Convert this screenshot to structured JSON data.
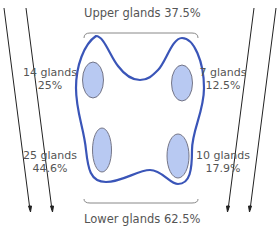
{
  "title": {
    "upper": "Upper glands 37.5%",
    "lower": "Lower glands 62.5%"
  },
  "glands": [
    {
      "id": "upper-left",
      "count": "14 glands",
      "percent": "25%"
    },
    {
      "id": "upper-right",
      "count": "7 glands",
      "percent": "12.5%"
    },
    {
      "id": "lower-left",
      "count": "25 glands",
      "percent": "44.6%"
    },
    {
      "id": "lower-right",
      "count": "10 glands",
      "percent": "17.9%"
    }
  ],
  "colors": {
    "outline": "#3a55b8",
    "gland_fill": "#b8c9f2",
    "gland_stroke": "#6a6a7a",
    "bracket": "#888888",
    "arrow": "#222222",
    "text": "#555555"
  }
}
